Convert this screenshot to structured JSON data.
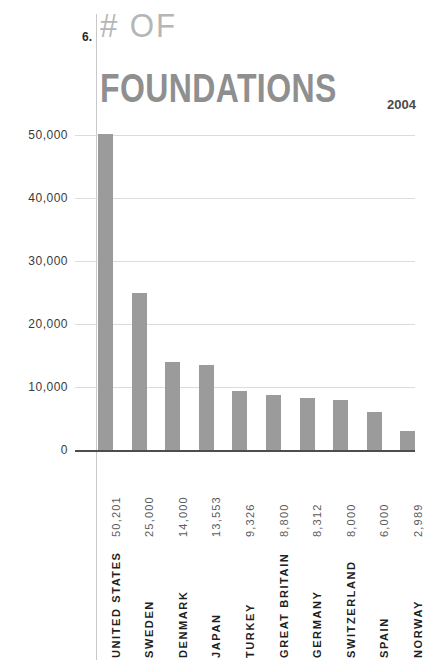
{
  "header": {
    "number": "6.",
    "line1": "# OF",
    "line2": "FOUNDATIONS",
    "year": "2004"
  },
  "colors": {
    "bar": "#9b9b9b",
    "gridline": "#dcdcdc",
    "axis": "#4d4d4d",
    "title_light": "#b6b6b6",
    "title_bold": "#8f8f8f",
    "value_label": "#5b5b5b",
    "country_label": "#1f1f1f"
  },
  "chart_data": {
    "type": "bar",
    "title": "# OF FOUNDATIONS",
    "subtitle": "2004",
    "xlabel": "",
    "ylabel": "",
    "ylim": [
      0,
      50000
    ],
    "grid": true,
    "legend": false,
    "ytick_labels": [
      "50,000",
      "40,000",
      "30,000",
      "20,000",
      "10,000",
      "0"
    ],
    "ytick_values": [
      50000,
      40000,
      30000,
      20000,
      10000,
      0
    ],
    "categories": [
      "UNITED STATES",
      "SWEDEN",
      "DENMARK",
      "JAPAN",
      "TURKEY",
      "GREAT BRITAIN",
      "GERMANY",
      "SWITZERLAND",
      "SPAIN",
      "NORWAY"
    ],
    "values": [
      50201,
      25000,
      14000,
      13553,
      9326,
      8800,
      8312,
      8000,
      6000,
      2989
    ],
    "value_labels": [
      "50,201",
      "25,000",
      "14,000",
      "13,553",
      "9,326",
      "8,800",
      "8,312",
      "8,000",
      "6,000",
      "2,989"
    ]
  }
}
